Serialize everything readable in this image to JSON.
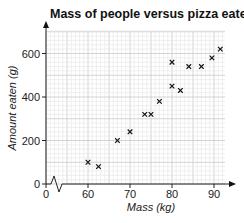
{
  "chart_data": {
    "type": "scatter",
    "title": "Mass of people versus pizza eaten",
    "xlabel": "Mass (kg)",
    "ylabel": "Amount eaten (g)",
    "x_ticks": [
      0,
      60,
      70,
      80,
      90
    ],
    "y_ticks": [
      0,
      200,
      400,
      600
    ],
    "xlim": [
      55,
      92.5
    ],
    "ylim": [
      0,
      700
    ],
    "x_axis_break": true,
    "grid": true,
    "marker": "x",
    "points": [
      {
        "x": 60,
        "y": 100
      },
      {
        "x": 62.5,
        "y": 80
      },
      {
        "x": 67,
        "y": 200
      },
      {
        "x": 70,
        "y": 240
      },
      {
        "x": 73.5,
        "y": 320
      },
      {
        "x": 75,
        "y": 320
      },
      {
        "x": 77,
        "y": 380
      },
      {
        "x": 80,
        "y": 560
      },
      {
        "x": 80,
        "y": 450
      },
      {
        "x": 82,
        "y": 430
      },
      {
        "x": 84,
        "y": 540
      },
      {
        "x": 87,
        "y": 540
      },
      {
        "x": 89.5,
        "y": 580
      },
      {
        "x": 91.5,
        "y": 620
      }
    ]
  }
}
